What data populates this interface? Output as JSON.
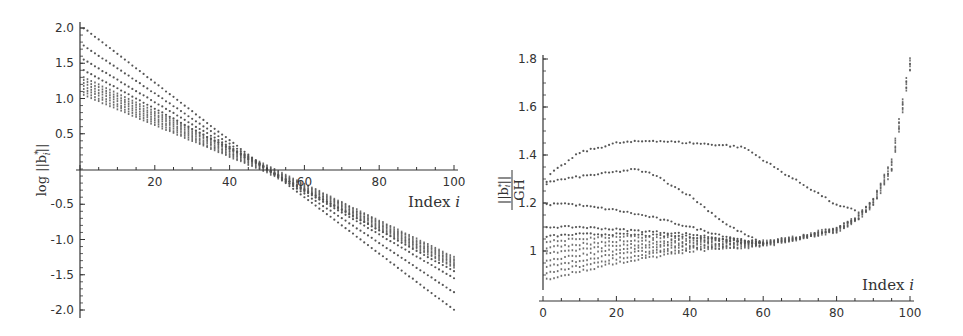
{
  "chart_data": [
    {
      "id": "left",
      "type": "scatter",
      "title": "",
      "xlabel": "Index i",
      "ylabel": "log ||b*_i||",
      "xlim": [
        0,
        100
      ],
      "ylim": [
        -2.0,
        2.0
      ],
      "x_ticks": [
        20,
        40,
        60,
        80,
        100
      ],
      "y_ticks": [
        2.0,
        1.5,
        1.0,
        0.5,
        -0.5,
        -1.0,
        -1.5,
        -2.0
      ],
      "y_tick_labels": [
        "2.0",
        "1.5",
        "1.0",
        "0.5",
        "-0.5",
        "-1.0",
        "-1.5",
        "-2.0"
      ],
      "grid": false,
      "legend": null,
      "marker_color": "#555555",
      "series": [
        {
          "name": "profile-1",
          "x": [
            1,
            50,
            100
          ],
          "values": [
            2.0,
            0.0,
            -2.0
          ]
        },
        {
          "name": "profile-2",
          "x": [
            1,
            50,
            100
          ],
          "values": [
            1.75,
            0.0,
            -1.75
          ]
        },
        {
          "name": "profile-3",
          "x": [
            1,
            50,
            100
          ],
          "values": [
            1.55,
            0.0,
            -1.55
          ]
        },
        {
          "name": "profile-4",
          "x": [
            1,
            50,
            100
          ],
          "values": [
            1.4,
            0.0,
            -1.45
          ]
        },
        {
          "name": "bulk-band",
          "x": [
            1,
            50,
            100
          ],
          "values_high": [
            1.3,
            0.05,
            -1.25
          ],
          "values_low": [
            1.05,
            -0.05,
            -1.4
          ]
        }
      ]
    },
    {
      "id": "right",
      "type": "scatter",
      "title": "",
      "xlabel": "Index i",
      "ylabel": "||b*_i|| / GH",
      "xlim": [
        0,
        100
      ],
      "ylim": [
        0.88,
        1.8
      ],
      "x_ticks": [
        0,
        20,
        40,
        60,
        80,
        100
      ],
      "y_ticks": [
        1.8,
        1.6,
        1.4,
        1.2,
        1.0
      ],
      "y_tick_labels": [
        "1.8",
        "1.6",
        "1.4",
        "1.2",
        "1"
      ],
      "grid": false,
      "legend": null,
      "marker_color": "#555555",
      "series": [
        {
          "name": "profile-1",
          "x": [
            0,
            2,
            10,
            20,
            30,
            40,
            50,
            55,
            65,
            75,
            80,
            85
          ],
          "values": [
            1.25,
            1.32,
            1.41,
            1.45,
            1.46,
            1.45,
            1.44,
            1.43,
            1.33,
            1.24,
            1.19,
            1.17
          ]
        },
        {
          "name": "profile-2",
          "x": [
            0,
            2,
            10,
            20,
            25,
            30,
            40,
            50,
            60
          ],
          "values": [
            1.27,
            1.29,
            1.31,
            1.33,
            1.34,
            1.32,
            1.23,
            1.11,
            1.03
          ]
        },
        {
          "name": "profile-3",
          "x": [
            0,
            5,
            10,
            20,
            30,
            40,
            50,
            60
          ],
          "values": [
            1.19,
            1.2,
            1.19,
            1.17,
            1.14,
            1.1,
            1.06,
            1.03
          ]
        },
        {
          "name": "profile-4",
          "x": [
            0,
            5,
            10,
            20,
            30,
            40,
            50,
            60
          ],
          "values": [
            1.1,
            1.1,
            1.1,
            1.09,
            1.08,
            1.07,
            1.05,
            1.03
          ]
        },
        {
          "name": "profile-5",
          "x": [
            0,
            10,
            20,
            40,
            60
          ],
          "values": [
            1.06,
            1.07,
            1.07,
            1.06,
            1.03
          ]
        },
        {
          "name": "bulk-band",
          "x": [
            0,
            20,
            40,
            60,
            70,
            80,
            85,
            90,
            95,
            100
          ],
          "values_high": [
            1.04,
            1.06,
            1.05,
            1.04,
            1.06,
            1.1,
            1.14,
            1.22,
            1.38,
            1.8
          ],
          "values_low": [
            0.88,
            0.95,
            1.0,
            1.02,
            1.05,
            1.08,
            1.12,
            1.19,
            1.33,
            1.75
          ]
        }
      ]
    }
  ],
  "labels": {
    "left_xlabel_text": "Index ",
    "left_xlabel_var": "i",
    "right_xlabel_text": "Index ",
    "right_xlabel_var": "i",
    "left_ylabel": "log ||b",
    "left_ylabel_sub": "i",
    "left_ylabel_sup": "*",
    "left_ylabel_end": "||",
    "right_ylabel_num": "||b",
    "right_ylabel_sub": "i",
    "right_ylabel_sup": "*",
    "right_ylabel_num_end": "||",
    "right_ylabel_den": "GH"
  }
}
